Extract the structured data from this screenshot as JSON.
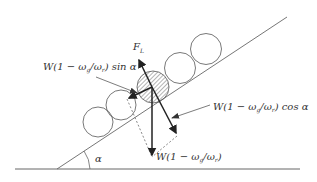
{
  "diagram": {
    "labels": {
      "lift_force": "F",
      "lift_force_sub": "L",
      "sin_component": "W(1 − ω",
      "sin_component_sub1": "g",
      "sin_component_mid": "/ω",
      "sin_component_sub2": "r",
      "sin_component_tail": ") sin α",
      "cos_component": "W(1 − ω",
      "cos_component_sub1": "g",
      "cos_component_mid": "/ω",
      "cos_component_sub2": "r",
      "cos_component_tail": ") cos α",
      "weight": "W(1 − ω",
      "weight_sub1": "g",
      "weight_mid": "/ω",
      "weight_sub2": "r",
      "weight_tail": ")",
      "angle": "α"
    },
    "colors": {
      "line": "#555555",
      "arrow": "#222222",
      "text": "#333333",
      "background": "#ffffff"
    }
  }
}
